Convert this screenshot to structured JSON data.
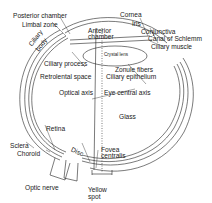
{
  "diagram": {
    "colors": {
      "line": "#222222",
      "background": "#ffffff",
      "text": "#1a1a1a"
    },
    "labels": {
      "posterior_chamber": "Posterior chamber",
      "limbal_zone": "Limbal zone",
      "ciliary_body_1": "Ciliary",
      "ciliary_body_2": "body",
      "anterior_chamber_1": "Anterior",
      "anterior_chamber_2": "chamber",
      "crystal_lens": "Crystal lens",
      "cornea": "Cornea",
      "iris": "Iris",
      "conjunctiva": "Conjunctiva",
      "canal_of_schlemm": "Canal of Schlemm",
      "ciliary_muscle": "Ciliary muscle",
      "ciliary_process": "Ciliary process",
      "zonule_fibers": "Zonule fibers",
      "ciliary_epithelium": "Ciliary epithelium",
      "retrolental_space": "Retrolental space",
      "optical_axis": "Optical axis",
      "eye_central_axis": "Eye central axis",
      "glass": "Glass",
      "retina": "Retina",
      "sclera": "Sclera",
      "choroid": "Choroid",
      "disc": "Disc",
      "fovea_centralis_1": "Fovea",
      "fovea_centralis_2": "centralis",
      "optic_nerve": "Optic nerve",
      "yellow_spot_1": "Yellow",
      "yellow_spot_2": "spot"
    }
  }
}
